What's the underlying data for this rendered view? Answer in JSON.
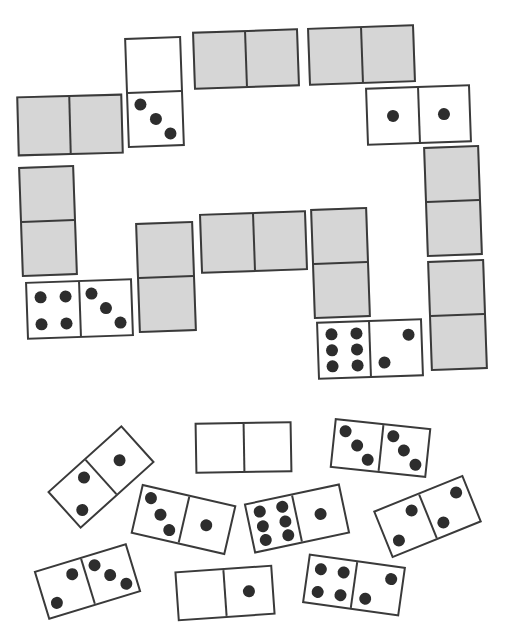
{
  "puzzle": {
    "colors": {
      "hidden_fill": "#d6d6d6",
      "visible_fill": "#ffffff",
      "outline": "#3a3a3a",
      "pip": "#2d2d2d"
    },
    "placed_dominoes": [
      {
        "id": "p1",
        "orientation": "h",
        "x": 17,
        "y": 95,
        "w": 106,
        "h": 60,
        "rotate": -1.5,
        "hidden": true,
        "values": [
          null,
          null
        ]
      },
      {
        "id": "p2",
        "orientation": "v",
        "x": 126,
        "y": 37,
        "w": 57,
        "h": 110,
        "rotate": -2,
        "hidden": false,
        "values": [
          0,
          3
        ]
      },
      {
        "id": "p3",
        "orientation": "h",
        "x": 193,
        "y": 30,
        "w": 106,
        "h": 58,
        "rotate": -2,
        "hidden": true,
        "values": [
          null,
          null
        ]
      },
      {
        "id": "p4",
        "orientation": "h",
        "x": 308,
        "y": 26,
        "w": 107,
        "h": 58,
        "rotate": -2,
        "hidden": true,
        "values": [
          null,
          null
        ]
      },
      {
        "id": "p5",
        "orientation": "h",
        "x": 366,
        "y": 86,
        "w": 105,
        "h": 58,
        "rotate": -2,
        "hidden": false,
        "values": [
          1,
          1
        ]
      },
      {
        "id": "p6",
        "orientation": "v",
        "x": 425,
        "y": 146,
        "w": 56,
        "h": 110,
        "rotate": -2,
        "hidden": true,
        "values": [
          null,
          null
        ]
      },
      {
        "id": "p7",
        "orientation": "v",
        "x": 20,
        "y": 166,
        "w": 56,
        "h": 110,
        "rotate": -2,
        "hidden": true,
        "values": [
          null,
          null
        ]
      },
      {
        "id": "p8",
        "orientation": "h",
        "x": 26,
        "y": 280,
        "w": 107,
        "h": 58,
        "rotate": -2,
        "hidden": false,
        "values": [
          4,
          3
        ]
      },
      {
        "id": "p9",
        "orientation": "v",
        "x": 137,
        "y": 222,
        "w": 58,
        "h": 110,
        "rotate": -2,
        "hidden": true,
        "values": [
          null,
          null
        ]
      },
      {
        "id": "p10",
        "orientation": "h",
        "x": 200,
        "y": 212,
        "w": 107,
        "h": 60,
        "rotate": -2,
        "hidden": true,
        "values": [
          null,
          null
        ]
      },
      {
        "id": "p11",
        "orientation": "v",
        "x": 312,
        "y": 208,
        "w": 57,
        "h": 110,
        "rotate": -2,
        "hidden": true,
        "values": [
          null,
          null
        ]
      },
      {
        "id": "p12",
        "orientation": "h",
        "x": 317,
        "y": 320,
        "w": 106,
        "h": 58,
        "rotate": -2,
        "hidden": false,
        "values": [
          6,
          2
        ]
      },
      {
        "id": "p13",
        "orientation": "v",
        "x": 429,
        "y": 260,
        "w": 57,
        "h": 110,
        "rotate": -2,
        "hidden": true,
        "values": [
          null,
          null
        ]
      }
    ],
    "loose_dominoes": [
      {
        "id": "l1",
        "orientation": "h",
        "cx": 101,
        "cy": 477,
        "w": 100,
        "h": 50,
        "rotate": -42,
        "values": [
          2,
          1
        ]
      },
      {
        "id": "l2",
        "orientation": "h",
        "cx": 243,
        "cy": 447,
        "w": 97,
        "h": 51,
        "rotate": -1,
        "values": [
          0,
          0
        ]
      },
      {
        "id": "l3",
        "orientation": "h",
        "cx": 380,
        "cy": 448,
        "w": 97,
        "h": 50,
        "rotate": 6,
        "values": [
          3,
          3
        ]
      },
      {
        "id": "l4",
        "orientation": "h",
        "cx": 183,
        "cy": 519,
        "w": 97,
        "h": 51,
        "rotate": 13,
        "values": [
          3,
          1
        ]
      },
      {
        "id": "l5",
        "orientation": "h",
        "cx": 297,
        "cy": 518,
        "w": 98,
        "h": 51,
        "rotate": -12,
        "values": [
          6,
          1
        ]
      },
      {
        "id": "l6",
        "orientation": "h",
        "cx": 427,
        "cy": 516,
        "w": 97,
        "h": 51,
        "rotate": -22,
        "values": [
          2,
          2
        ]
      },
      {
        "id": "l7",
        "orientation": "h",
        "cx": 87,
        "cy": 581,
        "w": 97,
        "h": 51,
        "rotate": -17,
        "values": [
          2,
          3
        ]
      },
      {
        "id": "l8",
        "orientation": "h",
        "cx": 225,
        "cy": 593,
        "w": 98,
        "h": 50,
        "rotate": -4,
        "values": [
          0,
          1
        ]
      },
      {
        "id": "l9",
        "orientation": "h",
        "cx": 354,
        "cy": 585,
        "w": 98,
        "h": 50,
        "rotate": 8,
        "values": [
          4,
          2
        ]
      }
    ]
  }
}
